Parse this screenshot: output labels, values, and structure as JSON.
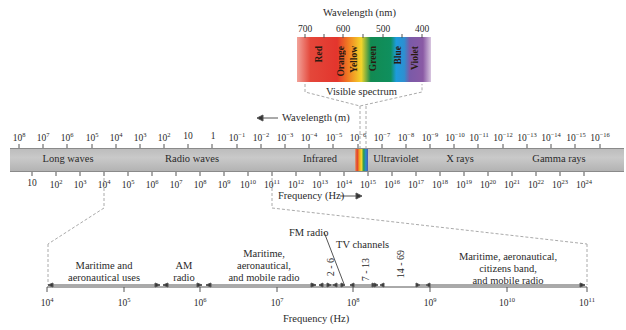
{
  "visible": {
    "title": "Wavelength (nm)",
    "ticks": [
      "700",
      "600",
      "500",
      "400"
    ],
    "colors": [
      "Red",
      "Orange",
      "Yellow",
      "Green",
      "Blue",
      "Violet"
    ],
    "caption": "Visible spectrum"
  },
  "main": {
    "wavelength_label": "Wavelength (m)",
    "wavelength_arrow": "←",
    "wavelength_ticks": [
      {
        "b": "10",
        "e": "8"
      },
      {
        "b": "10",
        "e": "7"
      },
      {
        "b": "10",
        "e": "6"
      },
      {
        "b": "10",
        "e": "5"
      },
      {
        "b": "10",
        "e": "4"
      },
      {
        "b": "10",
        "e": "3"
      },
      {
        "b": "10",
        "e": "2"
      },
      {
        "b": "10",
        "e": ""
      },
      {
        "b": "1",
        "e": ""
      },
      {
        "b": "10",
        "e": "−1"
      },
      {
        "b": "10",
        "e": "−2"
      },
      {
        "b": "10",
        "e": "−3"
      },
      {
        "b": "10",
        "e": "−4"
      },
      {
        "b": "10",
        "e": "−5"
      },
      {
        "b": "10",
        "e": "−6"
      },
      {
        "b": "10",
        "e": "−7"
      },
      {
        "b": "10",
        "e": "−8"
      },
      {
        "b": "10",
        "e": "−9"
      },
      {
        "b": "10",
        "e": "−10"
      },
      {
        "b": "10",
        "e": "−11"
      },
      {
        "b": "10",
        "e": "−12"
      },
      {
        "b": "10",
        "e": "−13"
      },
      {
        "b": "10",
        "e": "−14"
      },
      {
        "b": "10",
        "e": "−15"
      },
      {
        "b": "10",
        "e": "−16"
      }
    ],
    "regions": [
      "Long waves",
      "Radio waves",
      "Infrared",
      "Ultraviolet",
      "X rays",
      "Gamma rays"
    ],
    "frequency_ticks": [
      {
        "b": "10",
        "e": ""
      },
      {
        "b": "10",
        "e": "2"
      },
      {
        "b": "10",
        "e": "3"
      },
      {
        "b": "10",
        "e": "4"
      },
      {
        "b": "10",
        "e": "5"
      },
      {
        "b": "10",
        "e": "6"
      },
      {
        "b": "10",
        "e": "7"
      },
      {
        "b": "10",
        "e": "8"
      },
      {
        "b": "10",
        "e": "9"
      },
      {
        "b": "10",
        "e": "10"
      },
      {
        "b": "10",
        "e": "11"
      },
      {
        "b": "10",
        "e": "12"
      },
      {
        "b": "10",
        "e": "13"
      },
      {
        "b": "10",
        "e": "14"
      },
      {
        "b": "10",
        "e": "15"
      },
      {
        "b": "10",
        "e": "16"
      },
      {
        "b": "10",
        "e": "17"
      },
      {
        "b": "10",
        "e": "18"
      },
      {
        "b": "10",
        "e": "19"
      },
      {
        "b": "10",
        "e": "20"
      },
      {
        "b": "10",
        "e": "21"
      },
      {
        "b": "10",
        "e": "22"
      },
      {
        "b": "10",
        "e": "23"
      },
      {
        "b": "10",
        "e": "24"
      }
    ],
    "frequency_label": "Frequency (Hz)",
    "frequency_arrow": "→"
  },
  "radio": {
    "bands": [
      {
        "l1": "Maritime and",
        "l2": "aeronautical uses",
        "l3": ""
      },
      {
        "l1": "AM",
        "l2": "radio",
        "l3": ""
      },
      {
        "l1": "Maritime,",
        "l2": "aeronautical,",
        "l3": "and mobile radio"
      },
      {
        "l1": "Maritime, aeronautical,",
        "l2": "citizens band,",
        "l3": "and mobile radio"
      }
    ],
    "fm_label": "FM radio",
    "tv_label": "TV channels",
    "tv_ranges": [
      "2 - 6",
      "7 - 13",
      "14 - 69"
    ],
    "ticks": [
      {
        "b": "10",
        "e": "4"
      },
      {
        "b": "10",
        "e": "5"
      },
      {
        "b": "10",
        "e": "6"
      },
      {
        "b": "10",
        "e": "7"
      },
      {
        "b": "10",
        "e": "8"
      },
      {
        "b": "10",
        "e": "9"
      },
      {
        "b": "10",
        "e": "10"
      },
      {
        "b": "10",
        "e": "11"
      }
    ],
    "axis_label": "Frequency (Hz)"
  }
}
